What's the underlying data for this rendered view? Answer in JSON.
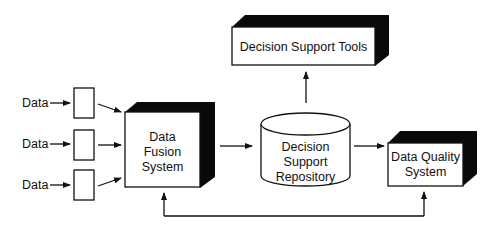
{
  "diagram": {
    "inputs": [
      {
        "label": "Data"
      },
      {
        "label": "Data"
      },
      {
        "label": "Data"
      }
    ],
    "fusion": {
      "line1": "Data",
      "line2": "Fusion",
      "line3": "System"
    },
    "repository": {
      "line1": "Decision",
      "line2": "Support",
      "line3": "Repository"
    },
    "tools": {
      "label": "Decision Support Tools"
    },
    "quality": {
      "line1": "Data Quality",
      "line2": "System"
    },
    "colors": {
      "stroke": "#111111",
      "fill": "#ffffff",
      "shadow": "#0a0a0a"
    }
  }
}
